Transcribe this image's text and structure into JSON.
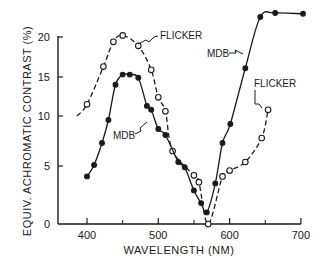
{
  "chart_data": {
    "type": "line",
    "title": "",
    "xlabel": "WAVELENGTH (NM)",
    "ylabel": "EQUIV. ACHROMATIC CONTRAST (%)",
    "xlim": [
      380,
      710
    ],
    "ylim": [
      0,
      23
    ],
    "x_ticks": [
      400,
      500,
      600,
      700
    ],
    "x_minor_ticks": [
      450,
      550,
      650
    ],
    "y_ticks": [
      0,
      5,
      10,
      15,
      20
    ],
    "grid": false,
    "legend": "inline annotations",
    "series": [
      {
        "name": "FLICKER",
        "marker": "open-circle",
        "line": "dashed",
        "x": [
          400,
          423,
          437,
          450,
          472,
          490,
          500,
          510,
          520,
          550,
          557,
          570,
          590,
          600,
          622,
          645,
          654
        ],
        "y": [
          11.5,
          16.3,
          19.4,
          20.2,
          18.9,
          15.9,
          12.4,
          10.6,
          6.5,
          4.2,
          3.6,
          0.0,
          4.1,
          4.6,
          5.4,
          7.8,
          10.8
        ]
      },
      {
        "name": "MDB",
        "marker": "filled-circle",
        "line": "solid",
        "x": [
          400,
          410,
          421,
          430,
          440,
          450,
          460,
          472,
          484,
          490,
          500,
          510,
          528,
          537,
          550,
          560,
          568,
          580,
          590,
          601,
          622,
          643,
          664,
          703
        ],
        "y": [
          4.1,
          5.1,
          7.3,
          9.6,
          14.0,
          15.3,
          15.3,
          14.9,
          11.3,
          10.8,
          8.7,
          8.1,
          5.4,
          4.9,
          2.9,
          1.8,
          1.0,
          3.5,
          7.3,
          9.2,
          16.1,
          22.5,
          23.0,
          22.9
        ]
      }
    ],
    "annotations": [
      {
        "text": "FLICKER",
        "near": [
          470,
          19.5
        ]
      },
      {
        "text": "MDB",
        "near": [
          490,
          10.5
        ]
      },
      {
        "text": "MDB",
        "near": [
          610,
          18.5
        ]
      },
      {
        "text": "FLICKER",
        "near": [
          660,
          14.0
        ]
      }
    ]
  },
  "labels": {
    "x_axis_title": "WAVELENGTH (NM)",
    "y_axis_title": "EQUIV. ACHROMATIC CONTRAST (%)",
    "ann_flicker_top": "FLICKER",
    "ann_mdb_left": "MDB",
    "ann_mdb_right": "MDB",
    "ann_flicker_right": "FLICKER"
  },
  "colors": {
    "ink": "#1a1a1a",
    "background": "#ffffff"
  }
}
